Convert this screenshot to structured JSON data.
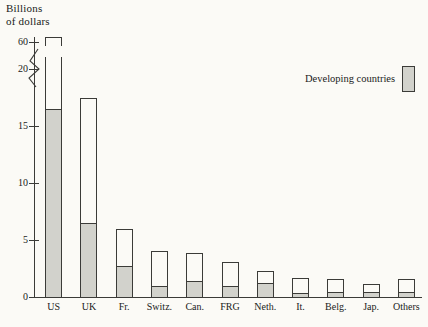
{
  "chart_data": {
    "type": "bar",
    "title_lines": [
      "Billions",
      "of dollars"
    ],
    "xlabel": "",
    "ylabel": "Billions of dollars",
    "ylim": [
      0,
      60
    ],
    "y_ticks": [
      0,
      5,
      10,
      15,
      20,
      60
    ],
    "y_tick_labels": [
      "0",
      "5",
      "10",
      "15",
      "20",
      "60"
    ],
    "axis_break": {
      "present": true,
      "between": [
        20,
        60
      ],
      "note": "zig-zag break on y-axis"
    },
    "grid": false,
    "legend": {
      "position": "top-right",
      "entries": [
        {
          "label": "Developing countries",
          "color": "#d2d2cc"
        }
      ]
    },
    "stacked": true,
    "categories": [
      "US",
      "UK",
      "Fr.",
      "Switz.",
      "Can.",
      "FRG",
      "Neth.",
      "It.",
      "Belg.",
      "Jap.",
      "Others"
    ],
    "series": [
      {
        "name": "Developing countries",
        "color": "#d2d2cc",
        "values": [
          16.5,
          6.5,
          2.7,
          1.0,
          1.4,
          1.0,
          1.2,
          0.35,
          0.4,
          0.4,
          0.4
        ]
      },
      {
        "name": "Total",
        "color": "#fbfaf6",
        "values": [
          60.0,
          17.5,
          6.0,
          4.0,
          3.9,
          3.1,
          2.3,
          1.7,
          1.6,
          1.1,
          1.6
        ]
      }
    ],
    "totals": [
      60.0,
      17.5,
      6.0,
      4.0,
      3.9,
      3.1,
      2.3,
      1.7,
      1.6,
      1.1,
      1.6
    ],
    "broken_bars": [
      "US"
    ],
    "annotations": []
  },
  "colors": {
    "background": "#fbfaf6",
    "ink": "#3b3b38",
    "developing_fill": "#d2d2cc"
  }
}
